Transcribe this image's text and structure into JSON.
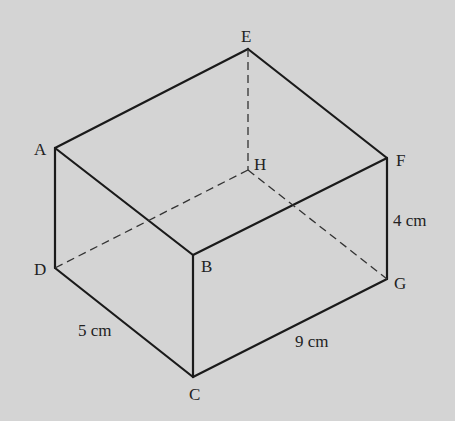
{
  "diagram": {
    "background": "#d4d4d4",
    "line_color": "#1a1a1a",
    "vertices": {
      "A": {
        "label": "A"
      },
      "B": {
        "label": "B"
      },
      "C": {
        "label": "C"
      },
      "D": {
        "label": "D"
      },
      "E": {
        "label": "E"
      },
      "F": {
        "label": "F"
      },
      "G": {
        "label": "G"
      },
      "H": {
        "label": "H"
      }
    },
    "dimensions": {
      "height": "4 cm",
      "width": "5 cm",
      "length": "9 cm"
    },
    "hidden_edges": [
      "EH",
      "DH",
      "HG"
    ],
    "visible_edges": [
      "AE",
      "EF",
      "AB",
      "BF",
      "AD",
      "BC",
      "FG",
      "DC",
      "CG"
    ]
  }
}
